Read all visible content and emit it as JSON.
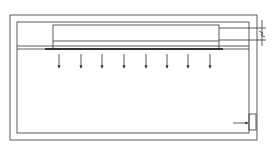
{
  "diagram": {
    "title": "",
    "colors": {
      "line": "#333333",
      "background": "#ffffff"
    },
    "outer_frame": {
      "x": 10,
      "y": 15,
      "w": 247,
      "h": 125
    },
    "inner_frame": {
      "x": 17,
      "y": 22,
      "w": 232,
      "h": 111
    },
    "top_box": {
      "x": 53,
      "y": 25,
      "w": 166,
      "h": 24,
      "divider_y": 41
    },
    "plate": {
      "x1": 45,
      "x2": 223,
      "y": 49
    },
    "rail_lines": [
      46,
      49
    ],
    "arrows": {
      "count": 8,
      "x": [
        59,
        81,
        102,
        124,
        146,
        167,
        188,
        210
      ],
      "y_start": 54,
      "y_end": 68
    },
    "leader_lines": [
      28,
      40
    ],
    "break_symbol": {
      "x": 262,
      "y": 34
    },
    "inlet_port": {
      "x": 249,
      "y": 114,
      "w": 7,
      "h": 16,
      "arrow_y": 123
    }
  }
}
